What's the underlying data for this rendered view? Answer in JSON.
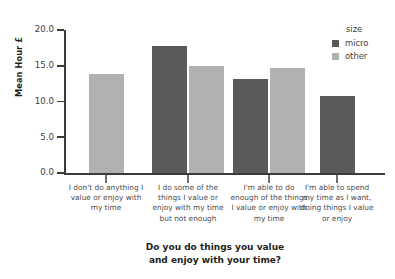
{
  "chart_data": {
    "type": "bar",
    "title": "",
    "xlabel": "Do you do things you value and enjoy with your time?",
    "ylabel": "Mean Hour £",
    "ylim": [
      0.0,
      20.0
    ],
    "yticks": [
      "0.0",
      "5.0",
      "10.0",
      "15.0",
      "20.0"
    ],
    "ytick_values": [
      0.0,
      5.0,
      10.0,
      15.0,
      20.0
    ],
    "grid": false,
    "legend_position": "upper right",
    "legend_title": "size",
    "categories": [
      "I don't do anything I value or enjoy with my time",
      "I do some of the things I value or enjoy with my time but not enough",
      "I'm able to do enough of the things I value or enjoy with my time",
      "I'm able to spend my time as I want, doing things I value or enjoy"
    ],
    "series": [
      {
        "name": "micro",
        "color": "#595a5c",
        "values": [
          null,
          17.8,
          13.2,
          10.8
        ]
      },
      {
        "name": "other",
        "color": "#b0b1b3",
        "values": [
          13.8,
          15.0,
          14.7,
          null
        ]
      }
    ]
  },
  "axes": {
    "y_label": "Mean Hour £",
    "y_ticks": [
      {
        "label": "20.0",
        "value": 20.0
      },
      {
        "label": "15.0",
        "value": 15.0
      },
      {
        "label": "10.0",
        "value": 10.0
      },
      {
        "label": "5.0",
        "value": 5.0
      },
      {
        "label": "0.0",
        "value": 0.0
      }
    ],
    "x_title_line1": "Do you do things you value",
    "x_title_line2": "and enjoy with your time?",
    "x_categories": [
      {
        "lines": [
          "I don't do anything I",
          "value or enjoy with",
          "my time"
        ]
      },
      {
        "lines": [
          "I do some of the",
          "things I value or",
          "enjoy with my time",
          "but not enough"
        ]
      },
      {
        "lines": [
          "I'm able to do",
          "enough of the things",
          "I value or enjoy with",
          "my time"
        ]
      },
      {
        "lines": [
          "I'm able to spend",
          "my time as I want,",
          "doing things I value",
          "or enjoy"
        ]
      }
    ]
  },
  "legend": {
    "title": "size",
    "entries": [
      {
        "label": "micro",
        "color": "#595a5c"
      },
      {
        "label": "other",
        "color": "#b0b1b3"
      }
    ]
  }
}
